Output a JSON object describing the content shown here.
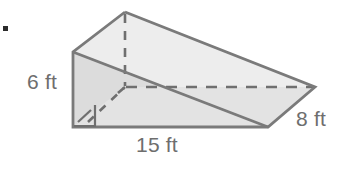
{
  "figure": {
    "kind": "triangular-prism-diagram",
    "bullet": "■",
    "labels": {
      "height": "6 ft",
      "length": "15 ft",
      "width": "8 ft"
    },
    "colors": {
      "edge": "#7a7a7a",
      "front_face_fill": "#dcdcdc",
      "top_face_fill": "#ededed",
      "bottom_face_fill": "#e3e3e3",
      "hidden_edge": "#6f6f6f",
      "label_text": "#6e6e6e",
      "bullet": "#2b2b2b",
      "background": "#ffffff"
    },
    "geometry": {
      "apex": "125,12",
      "front_top_left": "73,52",
      "front_bottom_left": "73,127",
      "front_bottom_right": "268,127",
      "right_point": "315,87",
      "hidden_back_bottom_left": "125,87"
    },
    "annotations": {
      "right_angle_marker": "square at front-bottom-left corner",
      "hidden_height_dash": "apex to hidden vertex",
      "hidden_depth_dash": "hidden vertex to right point",
      "hidden_diagonal_dash": "right-angle corner to hidden vertex"
    }
  }
}
